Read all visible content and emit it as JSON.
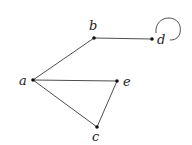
{
  "diagram": {
    "type": "undirected-graph",
    "nodes": [
      {
        "id": "a",
        "label": "a",
        "x": 33,
        "y": 80,
        "lx": 19,
        "ly": 85
      },
      {
        "id": "b",
        "label": "b",
        "x": 94,
        "y": 38,
        "lx": 89,
        "ly": 30
      },
      {
        "id": "d",
        "label": "d",
        "x": 152,
        "y": 39,
        "lx": 157,
        "ly": 44
      },
      {
        "id": "e",
        "label": "e",
        "x": 117,
        "y": 81,
        "lx": 123,
        "ly": 86
      },
      {
        "id": "c",
        "label": "c",
        "x": 97,
        "y": 127,
        "lx": 92,
        "ly": 141
      }
    ],
    "edges": [
      {
        "from": "a",
        "to": "b"
      },
      {
        "from": "b",
        "to": "d"
      },
      {
        "from": "a",
        "to": "e"
      },
      {
        "from": "a",
        "to": "c"
      },
      {
        "from": "e",
        "to": "c"
      },
      {
        "from": "d",
        "to": "d",
        "loop": true
      }
    ]
  }
}
